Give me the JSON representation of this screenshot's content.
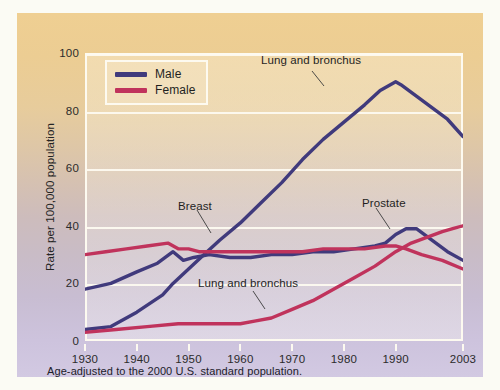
{
  "figure": {
    "footnote": "Age-adjusted to the 2000 U.S. standard population.",
    "bg_top_color": "#efcf92",
    "bg_bottom_color": "#d2c9e2",
    "frame_color": "#fdfaf0"
  },
  "legend": {
    "position": "top-left-inside",
    "entries": [
      {
        "label": "Male",
        "color": "#403a7c"
      },
      {
        "label": "Female",
        "color": "#c0335c"
      }
    ]
  },
  "annotations": [
    {
      "name": "male-lung-label",
      "text": "Lung and bronchus",
      "x": 244,
      "y": 41
    },
    {
      "name": "breast-label",
      "text": "Breast",
      "x": 161,
      "y": 187
    },
    {
      "name": "prostate-label",
      "text": "Prostate",
      "x": 345,
      "y": 184
    },
    {
      "name": "female-lung-label",
      "text": "Lung and bronchus",
      "x": 181,
      "y": 264
    }
  ],
  "chart_data": {
    "type": "line",
    "title": "",
    "subtitle": "",
    "xlabel": "",
    "ylabel": "Rate per 100,000 population",
    "xlim": [
      1930,
      2003
    ],
    "ylim": [
      0,
      100
    ],
    "xticks": [
      1930,
      1940,
      1950,
      1960,
      1970,
      1980,
      1990,
      2003
    ],
    "xtick_labels": [
      "1930",
      "1940",
      "1950",
      "1960",
      "1970",
      "1980",
      "1990",
      "2003"
    ],
    "yticks": [
      0,
      20,
      40,
      60,
      80,
      100
    ],
    "ytick_labels": [
      "0",
      "20",
      "40",
      "60",
      "80",
      "100"
    ],
    "grid": "horizontal",
    "legend_entries": [
      "Male",
      "Female"
    ],
    "series": [
      {
        "name": "Lung and bronchus (Male)",
        "sex": "Male",
        "color": "#403a7c",
        "x": [
          1930,
          1935,
          1940,
          1945,
          1947,
          1950,
          1953,
          1956,
          1960,
          1964,
          1968,
          1972,
          1976,
          1980,
          1984,
          1987,
          1990,
          1991,
          1994,
          1997,
          2000,
          2003
        ],
        "values": [
          4,
          5,
          10,
          16,
          20,
          25,
          30,
          35,
          41,
          48,
          55,
          63,
          70,
          76,
          82,
          87,
          90,
          89,
          85,
          81,
          77,
          71
        ]
      },
      {
        "name": "Prostate (Male)",
        "sex": "Male",
        "color": "#403a7c",
        "x": [
          1930,
          1935,
          1940,
          1944,
          1947,
          1949,
          1951,
          1954,
          1958,
          1962,
          1966,
          1970,
          1974,
          1978,
          1982,
          1986,
          1988,
          1990,
          1992,
          1994,
          1997,
          2000,
          2003
        ],
        "values": [
          18,
          20,
          24,
          27,
          31,
          28,
          29,
          30,
          29,
          29,
          30,
          30,
          31,
          31,
          32,
          33,
          34,
          37,
          39,
          39,
          35,
          31,
          28
        ]
      },
      {
        "name": "Breast (Female)",
        "sex": "Female",
        "color": "#c0335c",
        "x": [
          1930,
          1934,
          1938,
          1942,
          1946,
          1948,
          1950,
          1952,
          1956,
          1960,
          1964,
          1968,
          1972,
          1976,
          1980,
          1984,
          1988,
          1990,
          1992,
          1995,
          1999,
          2003
        ],
        "values": [
          30,
          31,
          32,
          33,
          34,
          32,
          32,
          31,
          31,
          31,
          31,
          31,
          31,
          32,
          32,
          32,
          33,
          33,
          32,
          30,
          28,
          25
        ]
      },
      {
        "name": "Lung and bronchus (Female)",
        "sex": "Female",
        "color": "#c0335c",
        "x": [
          1930,
          1936,
          1942,
          1948,
          1952,
          1956,
          1960,
          1963,
          1966,
          1970,
          1974,
          1978,
          1982,
          1986,
          1990,
          1993,
          1996,
          1999,
          2001,
          2003
        ],
        "values": [
          3,
          4,
          5,
          6,
          6,
          6,
          6,
          7,
          8,
          11,
          14,
          18,
          22,
          26,
          31,
          34,
          36,
          38,
          39,
          40
        ]
      }
    ],
    "note": "Breast and Prostate series cross near 1990; male lung peaks ~90 at 1990 then declines to ~71 at 2003"
  }
}
